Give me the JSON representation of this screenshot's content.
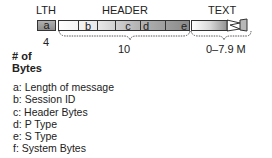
{
  "diagram": {
    "section_labels": {
      "lth": "LTH",
      "header": "HEADER",
      "text": "TEXT"
    },
    "boxes": {
      "lth_box": "a",
      "header_segments": [
        {
          "id": "blank1",
          "label": ""
        },
        {
          "id": "b",
          "label": "b"
        },
        {
          "id": "blank2",
          "label": ""
        },
        {
          "id": "c",
          "label": "c"
        },
        {
          "id": "d",
          "label": "d"
        },
        {
          "id": "e",
          "label": "e"
        }
      ]
    },
    "byte_counts": {
      "lth": "4",
      "header": "10",
      "text": "0–7.9 M"
    },
    "axis_label_line1": "# of",
    "axis_label_line2": "Bytes",
    "legend": [
      "a: Length of message",
      "b: Session ID",
      "c: Header Bytes",
      "d: P Type",
      "e: S Type",
      "f: System Bytes"
    ],
    "colors": {
      "box_fill_dark": "#9a9a9a",
      "box_fill_light": "#f2f2f2",
      "border": "#333333"
    }
  }
}
